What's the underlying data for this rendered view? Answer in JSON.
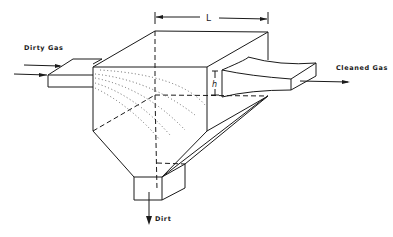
{
  "figure": {
    "labels": {
      "inlet": "Dirty Gas",
      "outlet": "Cleaned Gas",
      "bottom": "Dirt",
      "length": "L",
      "height": "h"
    },
    "colors": {
      "line": "#1a1a1a",
      "background": "#ffffff",
      "trajectory": "#555555"
    }
  }
}
